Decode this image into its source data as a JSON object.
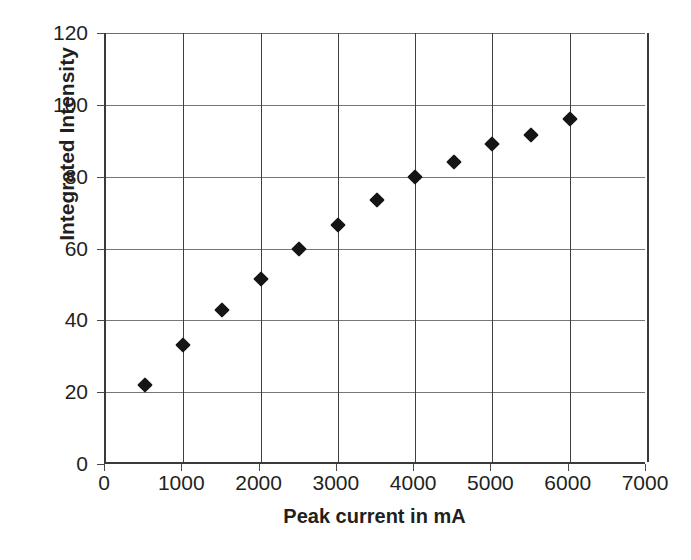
{
  "chart_data": {
    "type": "scatter",
    "title": "",
    "xlabel": "Peak current in mA",
    "ylabel": "Integrated Intensity",
    "xlim": [
      0,
      7000
    ],
    "ylim": [
      0,
      120
    ],
    "grid": true,
    "legend": null,
    "x": [
      500,
      1000,
      1500,
      2000,
      2500,
      3000,
      3500,
      4000,
      4500,
      5000,
      5500,
      6000
    ],
    "values": [
      22,
      33,
      43,
      51.5,
      60,
      66.5,
      73.5,
      80,
      84,
      89,
      91.5,
      96
    ],
    "xticks": [
      0,
      1000,
      2000,
      3000,
      4000,
      5000,
      6000,
      7000
    ],
    "xtick_labels": [
      "0",
      "1000",
      "2000",
      "3000",
      "4000",
      "5000",
      "6000",
      "7000"
    ],
    "yticks": [
      0,
      20,
      40,
      60,
      80,
      100,
      120
    ],
    "ytick_labels": [
      "0",
      "20",
      "40",
      "60",
      "80",
      "100",
      "120"
    ],
    "marker": "diamond",
    "marker_color": "#151515",
    "grid_color": "#777777",
    "axis_color": "#3a3a3a",
    "background": "#ffffff"
  },
  "caption": {
    "text": ""
  }
}
